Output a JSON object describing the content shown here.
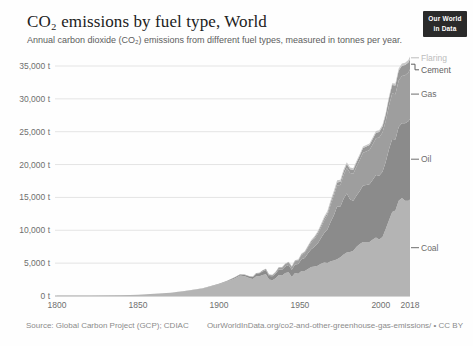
{
  "header": {
    "title": "CO₂ emissions by fuel type, World",
    "subtitle": "Annual carbon dioxide (CO₂) emissions from different fuel types, measured in tonnes per year.",
    "logo_line1": "Our World",
    "logo_line2": "in Data",
    "logo_bg": "#2a2a2a",
    "logo_fg": "#ffffff"
  },
  "footer": {
    "source": "Source: Global Carbon Project (GCP); CDIAC",
    "license": "OurWorldInData.org/co2-and-other-greenhouse-gas-emissions/ • CC BY"
  },
  "chart_data": {
    "type": "area",
    "stacked": true,
    "title": "CO₂ emissions by fuel type, World",
    "xlabel": "",
    "ylabel": "",
    "unit": "t",
    "grid": true,
    "legend_position": "right",
    "x_range": [
      1800,
      2018
    ],
    "y_range": [
      0,
      35000
    ],
    "y_ticks": [
      {
        "value": 0,
        "label": "0 t"
      },
      {
        "value": 5000,
        "label": "5,000 t"
      },
      {
        "value": 10000,
        "label": "10,000 t"
      },
      {
        "value": 15000,
        "label": "15,000 t"
      },
      {
        "value": 20000,
        "label": "20,000 t"
      },
      {
        "value": 25000,
        "label": "25,000 t"
      },
      {
        "value": 30000,
        "label": "30,000 t"
      },
      {
        "value": 35000,
        "label": "35,000 t"
      }
    ],
    "x_ticks": [
      {
        "value": 1800,
        "label": "1800"
      },
      {
        "value": 1850,
        "label": "1850"
      },
      {
        "value": 1900,
        "label": "1900"
      },
      {
        "value": 1950,
        "label": "1950"
      },
      {
        "value": 2000,
        "label": "2000"
      },
      {
        "value": 2018,
        "label": "2018"
      }
    ],
    "years": [
      1800,
      1810,
      1820,
      1830,
      1840,
      1850,
      1860,
      1870,
      1880,
      1890,
      1900,
      1905,
      1910,
      1913,
      1916,
      1919,
      1921,
      1923,
      1925,
      1927,
      1929,
      1931,
      1933,
      1935,
      1937,
      1939,
      1941,
      1943,
      1945,
      1947,
      1949,
      1951,
      1953,
      1955,
      1957,
      1959,
      1961,
      1963,
      1965,
      1967,
      1969,
      1971,
      1973,
      1975,
      1977,
      1979,
      1981,
      1983,
      1985,
      1987,
      1989,
      1991,
      1993,
      1995,
      1997,
      1999,
      2001,
      2003,
      2005,
      2007,
      2009,
      2011,
      2013,
      2015,
      2017,
      2018
    ],
    "series": [
      {
        "name": "Coal",
        "color": "#b4b4b4",
        "label_color": "#6d6d6d",
        "values": [
          30,
          40,
          50,
          80,
          110,
          200,
          330,
          500,
          780,
          1150,
          1800,
          2200,
          2700,
          3100,
          3000,
          2700,
          2600,
          3000,
          3000,
          3200,
          3300,
          2500,
          2400,
          2700,
          3200,
          3100,
          3500,
          3600,
          2900,
          3500,
          3400,
          3800,
          3800,
          4100,
          4400,
          4500,
          4600,
          4900,
          5100,
          5000,
          5300,
          5400,
          5600,
          5900,
          6300,
          6600,
          6700,
          6900,
          7500,
          7900,
          8200,
          8200,
          8200,
          8600,
          8900,
          8600,
          9000,
          10200,
          11500,
          12800,
          13000,
          14500,
          14900,
          14500,
          14500,
          14700
        ]
      },
      {
        "name": "Oil",
        "color": "#8b8b8b",
        "label_color": "#6d6d6d",
        "values": [
          0,
          0,
          0,
          0,
          0,
          0,
          0,
          0,
          10,
          30,
          60,
          100,
          150,
          180,
          210,
          250,
          300,
          400,
          450,
          550,
          650,
          550,
          600,
          700,
          850,
          900,
          1000,
          1100,
          1100,
          1300,
          1450,
          1800,
          2000,
          2400,
          2700,
          3000,
          3400,
          3900,
          4500,
          5100,
          6000,
          6900,
          8000,
          7700,
          8500,
          9000,
          8000,
          7600,
          7800,
          8100,
          8600,
          8700,
          8800,
          9100,
          9500,
          9700,
          9900,
          10200,
          10800,
          11100,
          10800,
          11200,
          11400,
          11800,
          12100,
          12250
        ]
      },
      {
        "name": "Gas",
        "color": "#9e9e9e",
        "label_color": "#6d6d6d",
        "values": [
          0,
          0,
          0,
          0,
          0,
          0,
          0,
          0,
          0,
          0,
          10,
          20,
          30,
          40,
          50,
          60,
          70,
          80,
          100,
          130,
          170,
          160,
          170,
          220,
          280,
          300,
          350,
          400,
          450,
          500,
          550,
          650,
          750,
          900,
          1050,
          1200,
          1400,
          1600,
          1900,
          2200,
          2600,
          2950,
          3200,
          3300,
          3600,
          3900,
          4000,
          4100,
          4400,
          4700,
          5000,
          5100,
          5200,
          5400,
          5600,
          5800,
          6000,
          6200,
          6600,
          6900,
          6900,
          7100,
          7200,
          7300,
          7400,
          7550
        ]
      },
      {
        "name": "Cement",
        "color": "#979797",
        "label_color": "#5f5f5f",
        "values": [
          0,
          0,
          0,
          0,
          0,
          0,
          0,
          0,
          0,
          0,
          0,
          0,
          0,
          0,
          0,
          0,
          0,
          0,
          0,
          30,
          40,
          40,
          40,
          50,
          60,
          70,
          70,
          70,
          60,
          80,
          100,
          120,
          140,
          170,
          200,
          230,
          250,
          280,
          320,
          350,
          390,
          430,
          470,
          500,
          540,
          580,
          590,
          610,
          650,
          690,
          730,
          750,
          780,
          820,
          850,
          870,
          900,
          1000,
          1150,
          1300,
          1350,
          1500,
          1550,
          1550,
          1520,
          1550
        ]
      },
      {
        "name": "Flaring",
        "color": "#c8c8c8",
        "label_color": "#bcbcbc",
        "values": [
          0,
          0,
          0,
          0,
          0,
          0,
          0,
          0,
          0,
          0,
          0,
          0,
          0,
          0,
          0,
          0,
          0,
          0,
          0,
          0,
          0,
          10,
          10,
          20,
          20,
          30,
          30,
          40,
          40,
          60,
          80,
          100,
          110,
          130,
          150,
          170,
          200,
          230,
          260,
          300,
          330,
          350,
          350,
          300,
          300,
          280,
          250,
          230,
          220,
          220,
          230,
          240,
          240,
          250,
          260,
          250,
          250,
          260,
          270,
          280,
          280,
          300,
          320,
          350,
          380,
          400
        ]
      }
    ]
  }
}
